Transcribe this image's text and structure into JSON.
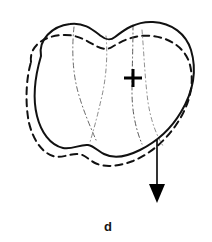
{
  "figure": {
    "panel_label": "d",
    "background_color": "#ffffff",
    "width_px": 212,
    "height_px": 242
  },
  "colors": {
    "ink": "#111111",
    "solid_contour": "#111111",
    "dashed_contour": "#111111",
    "internal_dashdot": "#555555",
    "arrow": "#000000",
    "label": "#151515",
    "background": "#ffffff"
  },
  "elements": {
    "solid_contour": {
      "name": "solid outline contour",
      "stroke_width": 2.0,
      "style": "solid",
      "path": "M 41 56 C 38 40, 52 26, 70 24 C 84 22, 93 30, 101 36 C 106 40, 110 41, 115 37 C 124 30, 136 21, 153 22 C 172 23, 186 34, 191 50 C 197 70, 193 92, 181 112 C 171 129, 156 142, 140 150 C 128 156, 114 159, 104 154 C 98 151, 94 146, 88 145 C 80 144, 72 150, 63 148 C 50 145, 41 132, 37 116 C 32 96, 36 73, 41 56 Z"
    },
    "dashed_contour": {
      "name": "offset dashed outline contour",
      "stroke_width": 2.0,
      "style": "dashed",
      "dash_pattern": "7 5",
      "path": "M 31 62 C 29 46, 44 36, 62 35 C 77 34, 87 41, 96 46 C 102 49, 107 50, 112 47 C 122 41, 135 34, 152 36 C 171 38, 186 49, 190 65 C 195 85, 189 106, 176 125 C 165 141, 150 154, 133 161 C 120 166, 105 168, 95 163 C 89 160, 85 155, 79 154 C 70 153, 62 159, 53 156 C 41 152, 33 139, 29 123 C 25 103, 26 79, 31 62 Z"
    },
    "internal_lines": [
      {
        "name": "left internal division",
        "style": "dash-dot",
        "stroke_width": 1.0,
        "dash_pattern": "5 3 1 3",
        "path": "M 74 27 C 72 46, 72 70, 78 92 C 83 110, 90 126, 96 140"
      },
      {
        "name": "centre internal division",
        "style": "dash-dot",
        "stroke_width": 1.0,
        "dash_pattern": "5 3 1 3",
        "path": "M 106 36 C 108 56, 106 80, 101 100 C 97 118, 93 132, 90 142"
      },
      {
        "name": "right internal division",
        "style": "dash-dot",
        "stroke_width": 1.0,
        "dash_pattern": "5 3 1 3",
        "path": "M 133 25 C 133 48, 132 72, 132 92 C 132 112, 136 130, 142 144"
      },
      {
        "name": "right outer internal division",
        "style": "dash-dot",
        "stroke_width": 1.0,
        "dash_pattern": "5 3 1 3",
        "path": "M 142 30 C 144 54, 145 80, 148 102 C 151 122, 157 136, 163 146"
      }
    ],
    "cross_marker": {
      "name": "landmark cross marker",
      "center_x": 133,
      "center_y": 78,
      "arm_length": 9,
      "stroke_width": 3.0
    },
    "arrow": {
      "name": "downward displacement arrow",
      "x": 157,
      "y_start": 140,
      "y_end": 203,
      "shaft_width": 1.6,
      "head_width": 16,
      "head_length": 19,
      "direction": "down"
    }
  }
}
